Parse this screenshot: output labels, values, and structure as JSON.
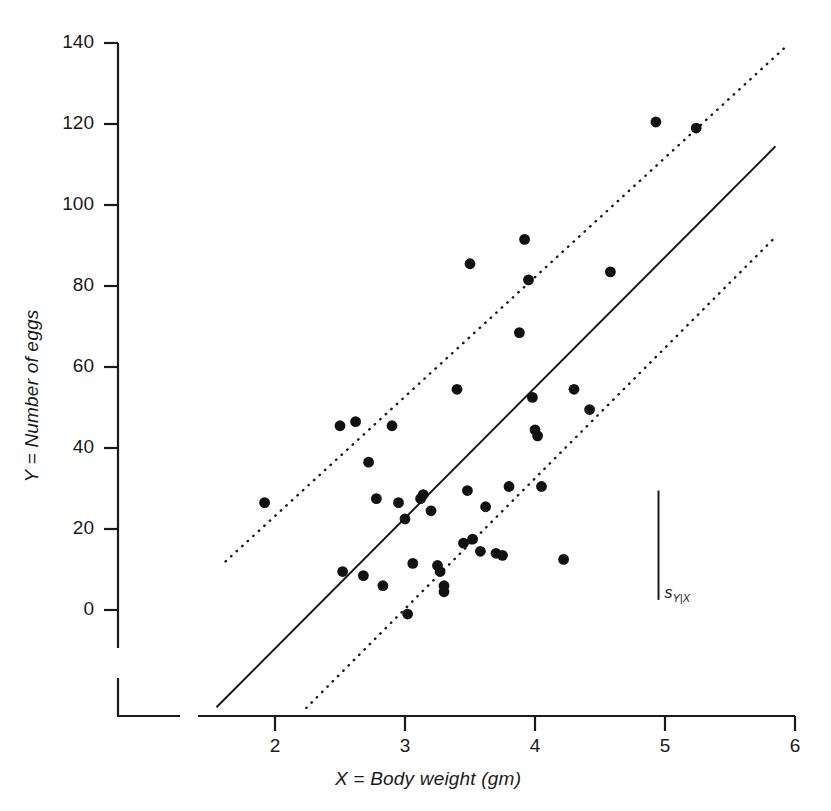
{
  "chart_data": {
    "type": "scatter",
    "title": "",
    "xlabel": "X = Body weight (gm)",
    "ylabel": "Y = Number of eggs",
    "xlim": [
      1.55,
      6.0
    ],
    "ylim": [
      -12,
      145
    ],
    "xticks": [
      2,
      3,
      4,
      5,
      6
    ],
    "xtick_labels": [
      "2",
      "3",
      "4",
      "5",
      "6"
    ],
    "yticks": [
      0,
      20,
      40,
      60,
      80,
      100,
      120,
      140
    ],
    "ytick_labels": [
      "0",
      "20",
      "40",
      "60",
      "80",
      "100",
      "120",
      "140"
    ],
    "grid": false,
    "legend": null,
    "axis_break": true,
    "points": [
      {
        "x": 1.92,
        "y": 26.5
      },
      {
        "x": 2.5,
        "y": 45.5
      },
      {
        "x": 2.52,
        "y": 9.5
      },
      {
        "x": 2.62,
        "y": 46.5
      },
      {
        "x": 2.68,
        "y": 8.5
      },
      {
        "x": 2.72,
        "y": 36.5
      },
      {
        "x": 2.78,
        "y": 27.5
      },
      {
        "x": 2.83,
        "y": 6.0
      },
      {
        "x": 2.9,
        "y": 45.5
      },
      {
        "x": 2.95,
        "y": 26.5
      },
      {
        "x": 3.0,
        "y": 22.5
      },
      {
        "x": 3.02,
        "y": -1.0
      },
      {
        "x": 3.06,
        "y": 11.5
      },
      {
        "x": 3.12,
        "y": 27.5
      },
      {
        "x": 3.14,
        "y": 28.5
      },
      {
        "x": 3.2,
        "y": 24.5
      },
      {
        "x": 3.25,
        "y": 11.0
      },
      {
        "x": 3.27,
        "y": 9.5
      },
      {
        "x": 3.3,
        "y": 6.0
      },
      {
        "x": 3.3,
        "y": 4.5
      },
      {
        "x": 3.4,
        "y": 54.5
      },
      {
        "x": 3.45,
        "y": 16.5
      },
      {
        "x": 3.48,
        "y": 29.5
      },
      {
        "x": 3.5,
        "y": 85.5
      },
      {
        "x": 3.52,
        "y": 17.5
      },
      {
        "x": 3.58,
        "y": 14.5
      },
      {
        "x": 3.62,
        "y": 25.5
      },
      {
        "x": 3.7,
        "y": 14.0
      },
      {
        "x": 3.75,
        "y": 13.5
      },
      {
        "x": 3.8,
        "y": 30.5
      },
      {
        "x": 3.88,
        "y": 68.5
      },
      {
        "x": 3.92,
        "y": 91.5
      },
      {
        "x": 3.95,
        "y": 81.5
      },
      {
        "x": 3.98,
        "y": 52.5
      },
      {
        "x": 4.0,
        "y": 44.5
      },
      {
        "x": 4.02,
        "y": 43.0
      },
      {
        "x": 4.05,
        "y": 30.5
      },
      {
        "x": 4.22,
        "y": 12.5
      },
      {
        "x": 4.3,
        "y": 54.5
      },
      {
        "x": 4.42,
        "y": 49.5
      },
      {
        "x": 4.58,
        "y": 83.5
      },
      {
        "x": 4.93,
        "y": 120.5
      },
      {
        "x": 5.24,
        "y": 119.0
      }
    ],
    "regression_line": {
      "style": "solid",
      "label": "least-squares regression line",
      "x0": 1.55,
      "y0": -24.0,
      "x1": 5.85,
      "y1": 114.5
    },
    "band_lines": [
      {
        "style": "dotted",
        "label": "upper band",
        "x0": 1.62,
        "y0": 12.0,
        "x1": 5.92,
        "y1": 138.8
      },
      {
        "style": "dotted",
        "label": "lower band",
        "x0": 2.24,
        "y0": -24.2,
        "x1": 5.84,
        "y1": 91.8
      }
    ],
    "error_bar": {
      "label": "sY|X",
      "label_main": "s",
      "label_sub": "Y|X",
      "x": 4.95,
      "y_top": 29.5,
      "y_bottom": 2.5
    },
    "colors": {
      "foreground": "#1a1a1a",
      "background": "#ffffff",
      "point": "#111111",
      "line": "#1a1a1a"
    }
  }
}
